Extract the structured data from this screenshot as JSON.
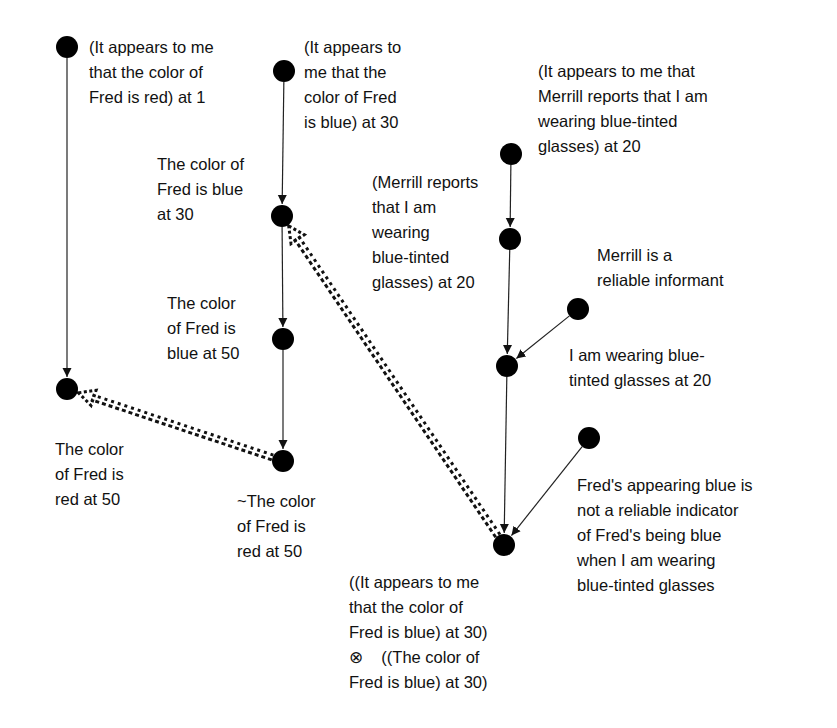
{
  "diagram": {
    "nodes": [
      {
        "id": "A",
        "x": 67,
        "y": 47,
        "label": "(It appears to me\nthat the color of\nFred is red) at 1",
        "lx": 89,
        "ly": 35
      },
      {
        "id": "B",
        "x": 67,
        "y": 389,
        "label": "The color\nof Fred is\nred at 50",
        "lx": 55,
        "ly": 437
      },
      {
        "id": "C",
        "x": 284,
        "y": 71,
        "label": "(It appears to\nme that the\ncolor of Fred\nis blue) at 30",
        "lx": 304,
        "ly": 35
      },
      {
        "id": "D",
        "x": 282,
        "y": 216,
        "label": "The color of\nFred is blue\nat 30",
        "lx": 157,
        "ly": 152
      },
      {
        "id": "E",
        "x": 283,
        "y": 339,
        "label": "The color\nof Fred is\nblue at 50",
        "lx": 167,
        "ly": 291
      },
      {
        "id": "F",
        "x": 283,
        "y": 461,
        "label": "~The color\nof Fred is\nred at 50",
        "lx": 237,
        "ly": 489
      },
      {
        "id": "G",
        "x": 511,
        "y": 154,
        "label": "(It appears to me that\nMerrill reports that I am\nwearing blue-tinted\nglasses) at 20",
        "lx": 538,
        "ly": 59
      },
      {
        "id": "H",
        "x": 510,
        "y": 239,
        "label": "(Merrill reports\nthat I am\nwearing\nblue-tinted\nglasses) at 20",
        "lx": 372,
        "ly": 170
      },
      {
        "id": "I",
        "x": 578,
        "y": 309,
        "label": "Merrill is a\nreliable informant",
        "lx": 597,
        "ly": 243
      },
      {
        "id": "J",
        "x": 507,
        "y": 366,
        "label": "I am wearing blue-\ntinted glasses at 20",
        "lx": 569,
        "ly": 343
      },
      {
        "id": "K",
        "x": 589,
        "y": 438,
        "label": "Fred's appearing blue is\nnot a reliable indicator\nof Fred's being blue\nwhen I am wearing\nblue-tinted glasses",
        "lx": 577,
        "ly": 473
      },
      {
        "id": "L",
        "x": 504,
        "y": 545,
        "label": "((It appears to me\nthat the color of\nFred is blue) at 30)\n⊗    ((The color of\nFred is blue) at 30)",
        "lx": 349,
        "ly": 570
      }
    ],
    "edges": [
      {
        "from": "A",
        "to": "B",
        "type": "solid"
      },
      {
        "from": "C",
        "to": "D",
        "type": "solid"
      },
      {
        "from": "D",
        "to": "E",
        "type": "solid"
      },
      {
        "from": "E",
        "to": "F",
        "type": "solid"
      },
      {
        "from": "G",
        "to": "H",
        "type": "solid"
      },
      {
        "from": "H",
        "to": "J",
        "type": "solid"
      },
      {
        "from": "I",
        "to": "J",
        "type": "solid"
      },
      {
        "from": "J",
        "to": "L",
        "type": "solid"
      },
      {
        "from": "K",
        "to": "L",
        "type": "solid"
      },
      {
        "from": "F",
        "to": "B",
        "type": "defeat"
      },
      {
        "from": "L",
        "to": "D",
        "type": "defeat"
      }
    ],
    "node_color": "#000000",
    "edge_color": "#222222"
  }
}
